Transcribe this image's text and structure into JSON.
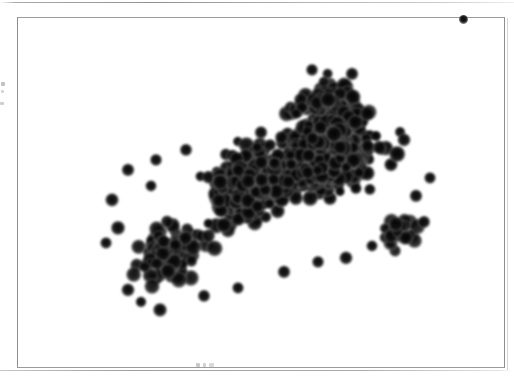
{
  "page": {
    "background_color": "#ffffff",
    "width": 514,
    "height": 385,
    "scan_rule_color": "#8c8c8c",
    "caption_smudge_text": "",
    "gutter_marks_count": 3
  },
  "figure": {
    "frame": {
      "x": 17,
      "y": 17,
      "width": 488,
      "height": 351,
      "border_color": "#8e8e8e",
      "border_width": 1,
      "fill_color": "#ffffff"
    },
    "edge_speck": {
      "label": "ink-speck",
      "x": 463,
      "y": 19,
      "diameter": 9,
      "color": "#0d0d0d"
    }
  },
  "micrograph": {
    "title": "",
    "caption": "",
    "modality": "brightfield-smear",
    "stain_color": "#0a0a0a",
    "background_color": "#ffffff",
    "cell_color": "#101010",
    "cell_halo_color": "#9a9a9a",
    "cell_count": 760,
    "cell_radius_min": 5.5,
    "cell_radius_max": 9.0,
    "blur_px": 1.1,
    "cluster": {
      "description": "dense elongated cluster of dark-stained round cells",
      "orientation_deg": -32,
      "bounding_box": {
        "x": 95,
        "y": 60,
        "width": 340,
        "height": 260
      }
    },
    "lobes": [
      {
        "name": "head-dense-right",
        "cx": 330,
        "cy": 150,
        "rx": 100,
        "ry": 80,
        "density": 1.0,
        "count": 330
      },
      {
        "name": "core-middle",
        "cx": 250,
        "cy": 185,
        "rx": 85,
        "ry": 62,
        "density": 0.95,
        "count": 210
      },
      {
        "name": "tail-lower-left",
        "cx": 170,
        "cy": 255,
        "rx": 62,
        "ry": 45,
        "density": 0.7,
        "count": 130
      },
      {
        "name": "crest-upper",
        "cx": 320,
        "cy": 100,
        "rx": 62,
        "ry": 32,
        "density": 0.78,
        "count": 60
      },
      {
        "name": "spur-right-lower",
        "cx": 398,
        "cy": 232,
        "rx": 42,
        "ry": 30,
        "density": 0.55,
        "count": 30
      }
    ],
    "outliers": [
      {
        "cx": 128,
        "cy": 170,
        "r": 7.0
      },
      {
        "cx": 151,
        "cy": 186,
        "r": 6.2
      },
      {
        "cx": 112,
        "cy": 200,
        "r": 7.4
      },
      {
        "cx": 156,
        "cy": 160,
        "r": 6.6
      },
      {
        "cx": 118,
        "cy": 228,
        "r": 7.8
      },
      {
        "cx": 106,
        "cy": 243,
        "r": 6.4
      },
      {
        "cx": 128,
        "cy": 290,
        "r": 7.2
      },
      {
        "cx": 141,
        "cy": 302,
        "r": 6.0
      },
      {
        "cx": 160,
        "cy": 310,
        "r": 7.6
      },
      {
        "cx": 204,
        "cy": 296,
        "r": 6.8
      },
      {
        "cx": 238,
        "cy": 288,
        "r": 6.4
      },
      {
        "cx": 284,
        "cy": 272,
        "r": 7.0
      },
      {
        "cx": 318,
        "cy": 262,
        "r": 6.6
      },
      {
        "cx": 346,
        "cy": 258,
        "r": 7.2
      },
      {
        "cx": 372,
        "cy": 246,
        "r": 6.2
      },
      {
        "cx": 406,
        "cy": 238,
        "r": 7.4
      },
      {
        "cx": 424,
        "cy": 222,
        "r": 6.8
      },
      {
        "cx": 416,
        "cy": 196,
        "r": 7.0
      },
      {
        "cx": 430,
        "cy": 178,
        "r": 6.4
      },
      {
        "cx": 404,
        "cy": 140,
        "r": 7.2
      },
      {
        "cx": 352,
        "cy": 74,
        "r": 7.0
      },
      {
        "cx": 312,
        "cy": 70,
        "r": 6.6
      },
      {
        "cx": 186,
        "cy": 150,
        "r": 6.8
      }
    ]
  }
}
